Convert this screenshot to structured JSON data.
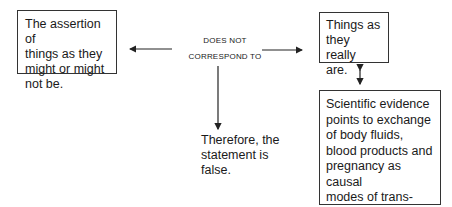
{
  "diagram": {
    "box_assertion": {
      "text": "The assertion of\nthings as they\nmight or might\nnot be."
    },
    "relation_label": {
      "line1": "DOES NOT",
      "line2": "CORRESPOND TO"
    },
    "box_reality": {
      "text": "Things as\nthey really\nare."
    },
    "conclusion": {
      "text": "Therefore, the\nstatement is\nfalse."
    },
    "box_evidence": {
      "text": "Scientific evidence\npoints to exchange\nof body fluids,\nblood products and\npregnancy as causal\nmodes of trans-\nmission."
    },
    "edges": [
      {
        "from": "relation_label",
        "to": "box_assertion",
        "type": "arrow-left"
      },
      {
        "from": "relation_label",
        "to": "box_reality",
        "type": "arrow-right"
      },
      {
        "from": "relation_label",
        "to": "conclusion",
        "type": "arrow-down"
      },
      {
        "from": "box_reality",
        "to": "box_evidence",
        "type": "double-arrow"
      }
    ]
  }
}
